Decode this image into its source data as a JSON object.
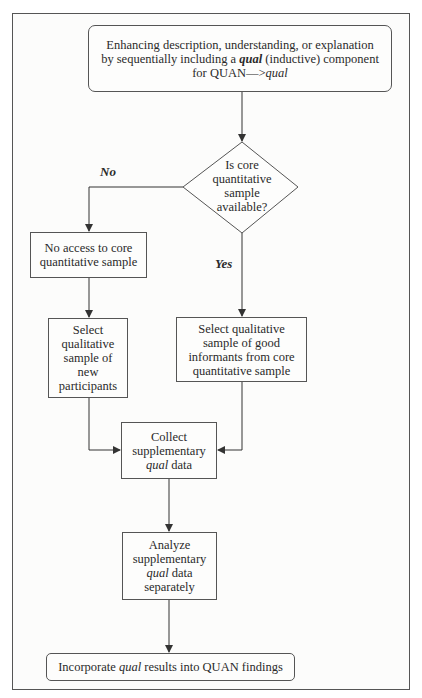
{
  "diagram": {
    "type": "flowchart",
    "start": {
      "line1": "Enhancing description, understanding, or explanation",
      "line2_pre": "by sequentially including a ",
      "line2_em": "qual",
      "line2_post": " (inductive) component",
      "line3_pre": "for QUAN—>",
      "line3_em": "qual"
    },
    "decision": {
      "lines": [
        "Is core",
        "quantitative",
        "sample",
        "available?"
      ]
    },
    "labels": {
      "no": "No",
      "yes": "Yes"
    },
    "no_access": {
      "line1": "No access to core",
      "line2": "quantitative sample"
    },
    "select_new": {
      "lines": [
        "Select",
        "qualitative",
        "sample of",
        "new",
        "participants"
      ]
    },
    "select_core": {
      "lines": [
        "Select qualitative",
        "sample of good",
        "informants from core",
        "quantitative sample"
      ]
    },
    "collect": {
      "line1": "Collect",
      "line2": "supplementary",
      "line3_em": "qual",
      "line3_post": " data"
    },
    "analyze": {
      "line1": "Analyze",
      "line2": "supplementary",
      "line3_em": "qual",
      "line3_post": " data",
      "line4": "separately"
    },
    "end": {
      "pre": "Incorporate ",
      "em": "qual",
      "post": " results into QUAN findings"
    },
    "colors": {
      "line": "#333333",
      "border": "#555555",
      "background": "#fcfcfb"
    }
  }
}
